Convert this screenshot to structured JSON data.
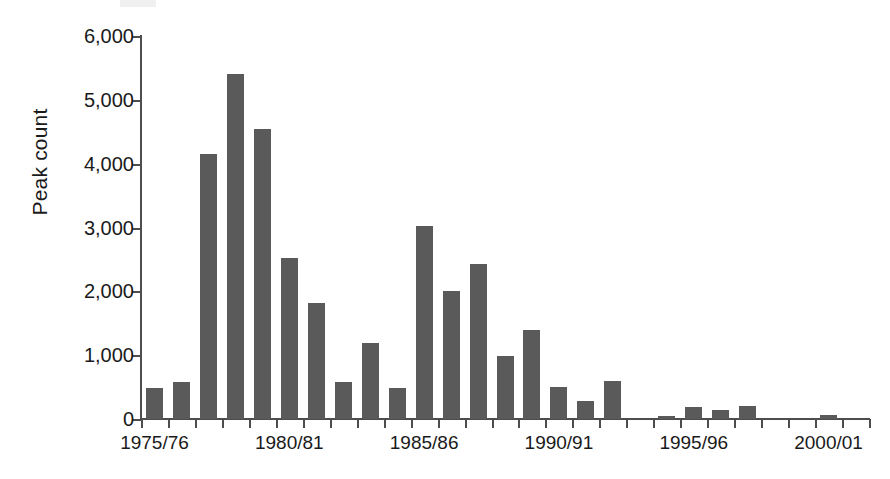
{
  "chart_data": {
    "type": "bar",
    "title": "",
    "subtitle": "",
    "xlabel": "",
    "ylabel": "Peak count",
    "ylim": [
      0,
      6000
    ],
    "grid": false,
    "legend": null,
    "bar_color": "#5a5a5a",
    "axis_color": "#4d4d4d",
    "y_ticks": [
      0,
      1000,
      2000,
      3000,
      4000,
      5000,
      6000
    ],
    "y_tick_labels": [
      "0",
      "1,000",
      "2,000",
      "3,000",
      "4,000",
      "5,000",
      "6,000"
    ],
    "x_tick_labels": [
      "1975/76",
      "1980/81",
      "1985/86",
      "1990/91",
      "1995/96",
      "2000/01"
    ],
    "x_tick_label_indices": [
      0,
      5,
      10,
      15,
      20,
      25
    ],
    "categories": [
      "1975/76",
      "1976/77",
      "1977/78",
      "1978/79",
      "1979/80",
      "1980/81",
      "1981/82",
      "1982/83",
      "1983/84",
      "1984/85",
      "1985/86",
      "1986/87",
      "1987/88",
      "1988/89",
      "1989/90",
      "1990/91",
      "1991/92",
      "1992/93",
      "1993/94",
      "1994/95",
      "1995/96",
      "1996/97",
      "1997/98",
      "1998/99",
      "1999/00",
      "2000/01",
      "2001/02"
    ],
    "values": [
      480,
      580,
      4150,
      5400,
      4550,
      2520,
      1810,
      580,
      1190,
      480,
      3030,
      2000,
      2430,
      990,
      1390,
      500,
      290,
      600,
      0,
      40,
      190,
      140,
      200,
      0,
      0,
      60,
      0
    ]
  }
}
